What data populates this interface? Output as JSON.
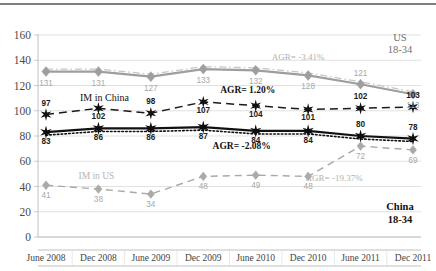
{
  "chart_data": {
    "type": "line",
    "title": "",
    "xlabel": "",
    "ylabel": "",
    "ylim": [
      0,
      160
    ],
    "yticks": [
      0,
      20,
      40,
      60,
      80,
      100,
      120,
      140,
      160
    ],
    "grid": true,
    "legend_position": "inline-annotations",
    "categories": [
      "June 2008",
      "Dec 2008",
      "June 2009",
      "Dec 2009",
      "June 2010",
      "Dec 2010",
      "June 2011",
      "Dec 2011"
    ],
    "series": [
      {
        "name": "US 18-34",
        "color": "#9e9e9e",
        "style": "solid-with-dashed-overlay",
        "marker": "diamond",
        "values": [
          131,
          131,
          127,
          133,
          132,
          128,
          121,
          113
        ]
      },
      {
        "name": "IM in China",
        "color": "#1b1b1b",
        "style": "dashed",
        "marker": "star",
        "values": [
          97,
          102,
          98,
          107,
          104,
          101,
          102,
          103
        ]
      },
      {
        "name": "China 18-34",
        "color": "#111111",
        "style": "solid-with-dotted-overlay",
        "marker": "star",
        "values": [
          83,
          86,
          86,
          87,
          84,
          84,
          80,
          78
        ]
      },
      {
        "name": "IM in US",
        "color": "#a8a8a8",
        "style": "dashed",
        "marker": "diamond",
        "values": [
          41,
          38,
          34,
          48,
          49,
          48,
          72,
          69
        ]
      }
    ],
    "annotations": [
      {
        "text": "AGR= -3.41%",
        "series": "US 18-34",
        "tone": "gray"
      },
      {
        "text": "AGR= 1.20%",
        "series": "IM in China",
        "tone": "dark"
      },
      {
        "text": "AGR= -2.08%",
        "series": "China 18-34",
        "tone": "dark"
      },
      {
        "text": "AGR= -19.37%",
        "series": "IM in US",
        "tone": "gray"
      }
    ],
    "inline_labels": [
      {
        "text": "IM in China",
        "tone": "dark"
      },
      {
        "text": "IM in US",
        "tone": "gray"
      }
    ],
    "corner_labels": [
      {
        "text_line1": "US",
        "text_line2": "18-34",
        "position": "top-right",
        "tone": "gray"
      },
      {
        "text_line1": "China",
        "text_line2": "18-34",
        "position": "bottom-right",
        "tone": "dark"
      }
    ]
  },
  "axis": {
    "y_ticks": [
      "160",
      "140",
      "120",
      "100",
      "80",
      "60",
      "40",
      "20",
      "0"
    ],
    "x_ticks": [
      "June 2008",
      "Dec 2008",
      "June 2009",
      "Dec 2009",
      "June 2010",
      "Dec 2010",
      "June 2011",
      "Dec 2011"
    ]
  },
  "labels": {
    "us_series_values": [
      "131",
      "131",
      "127",
      "133",
      "132",
      "128",
      "121",
      "113"
    ],
    "im_china_values": [
      "97",
      "102",
      "98",
      "107",
      "104",
      "101",
      "102",
      "103"
    ],
    "china_series_values": [
      "83",
      "86",
      "86",
      "87",
      "84",
      "84",
      "80",
      "78"
    ],
    "im_us_values": [
      "41",
      "38",
      "34",
      "48",
      "49",
      "48",
      "72",
      "69"
    ],
    "agr_us": "AGR= -3.41%",
    "agr_im_china": "AGR= 1.20%",
    "agr_china": "AGR= -2.08%",
    "agr_im_us": "AGR= -19.37%",
    "im_china_label": "IM in China",
    "im_us_label": "IM in US",
    "us_corner_1": "US",
    "us_corner_2": "18-34",
    "china_corner_1": "China",
    "china_corner_2": "18-34"
  }
}
